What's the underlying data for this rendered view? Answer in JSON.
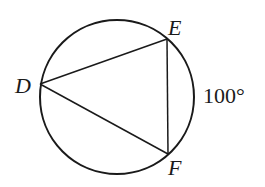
{
  "diagram": {
    "type": "inscribed-triangle-in-circle",
    "circle": {
      "cx": 117,
      "cy": 97,
      "r": 78
    },
    "points": {
      "D": {
        "label": "D",
        "x": 40,
        "y": 84
      },
      "E": {
        "label": "E",
        "x": 167,
        "y": 39
      },
      "F": {
        "label": "F",
        "x": 168,
        "y": 154
      }
    },
    "arc_label": "100°",
    "stroke_color": "#1a1a1a"
  }
}
